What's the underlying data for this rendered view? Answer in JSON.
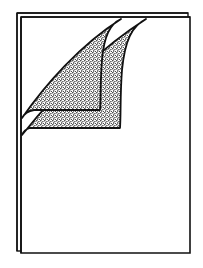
{
  "illustration": {
    "subject": "stack of pages with curled corners",
    "page_count": 2,
    "curled_flap_count": 2,
    "colors": {
      "background": "#ffffff",
      "ink": "#111111",
      "stipple_dark": "#1a1a1a",
      "stipple_light": "#ffffff"
    }
  }
}
